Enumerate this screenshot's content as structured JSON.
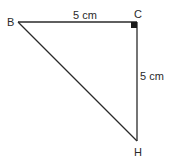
{
  "diagram": {
    "type": "right-triangle",
    "vertices": [
      {
        "label": "B",
        "x": 18,
        "y": 22
      },
      {
        "label": "C",
        "x": 137,
        "y": 22
      },
      {
        "label": "H",
        "x": 137,
        "y": 141
      }
    ],
    "right_angle_at": "C",
    "sides": {
      "BC": {
        "label": "5 cm"
      },
      "CH": {
        "label": "5 cm"
      }
    },
    "colors": {
      "stroke": "#2a2a2a",
      "background": "#ffffff"
    }
  },
  "labels": {
    "vertex_b": "B",
    "vertex_c": "C",
    "vertex_h": "H",
    "side_bc": "5 cm",
    "side_ch": "5 cm"
  }
}
